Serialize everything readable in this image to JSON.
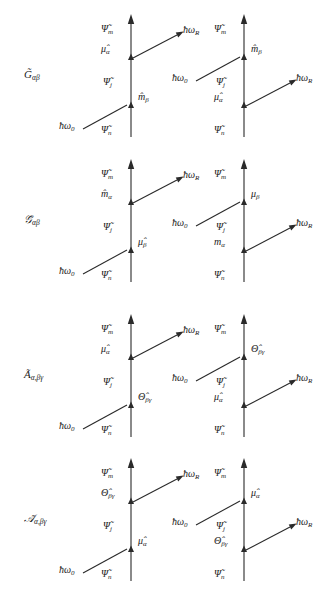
{
  "figure": {
    "type": "diagram",
    "columns": 2,
    "rows": 4,
    "geometry": {
      "left_line_x": 131,
      "right_line_x": 244,
      "row_tops": [
        8,
        153,
        308,
        452
      ],
      "row_height": 130
    },
    "symbols": {
      "psi_tilde": "Ψ̃",
      "hbar": "ħ",
      "omega": "ω",
      "mu_hat": "μ̂",
      "m_hat": "m̂",
      "theta_hat": "Θ̂",
      "mu_plain": "μ",
      "m_plain": "m"
    }
  },
  "rows": [
    {
      "id": "row-G",
      "label": "G̃",
      "label_sub": "αβ",
      "label_full": "G̃αβ",
      "panels": [
        {
          "id": "G-left",
          "states": {
            "top": "Ψ̃",
            "top_sub": "m",
            "mid": "Ψ̃",
            "mid_sub": "j",
            "bottom": "Ψ̃",
            "bottom_sub": "n"
          },
          "upper_vertex": {
            "operator": "μ̂",
            "operator_sub": "α",
            "side": "left"
          },
          "lower_vertex": {
            "operator": "m̂",
            "operator_sub": "β",
            "side": "right"
          },
          "photon_in": {
            "label": "ħω",
            "label_sub": "0",
            "attaches": "lower",
            "direction": "incoming"
          },
          "photon_out": {
            "label": "ħω",
            "label_sub": "R",
            "attaches": "upper",
            "direction": "outgoing"
          }
        },
        {
          "id": "G-right",
          "states": {
            "top": "Ψ̃",
            "top_sub": "m",
            "mid": "Ψ̃",
            "mid_sub": "j",
            "bottom": "Ψ̃",
            "bottom_sub": "n"
          },
          "upper_vertex": {
            "operator": "m̂",
            "operator_sub": "β",
            "side": "right"
          },
          "lower_vertex": {
            "operator": "μ̂",
            "operator_sub": "α",
            "side": "left"
          },
          "photon_in": {
            "label": "ħω",
            "label_sub": "0",
            "attaches": "upper",
            "direction": "incoming"
          },
          "photon_out": {
            "label": "ħω",
            "label_sub": "R",
            "attaches": "lower",
            "direction": "outgoing"
          }
        }
      ]
    },
    {
      "id": "row-Gscript",
      "label": "𝒢̃",
      "label_sub": "αβ",
      "label_full": "𝒢̃αβ",
      "panels": [
        {
          "id": "Gscript-left",
          "states": {
            "top": "Ψ̃",
            "top_sub": "m",
            "mid": "Ψ̃",
            "mid_sub": "j",
            "bottom": "Ψ̃",
            "bottom_sub": "n"
          },
          "upper_vertex": {
            "operator": "m̂",
            "operator_sub": "α",
            "side": "left"
          },
          "lower_vertex": {
            "operator": "μ̂",
            "operator_sub": "β",
            "side": "right"
          },
          "photon_in": {
            "label": "ħω",
            "label_sub": "0",
            "attaches": "lower",
            "direction": "incoming"
          },
          "photon_out": {
            "label": "ħω",
            "label_sub": "R",
            "attaches": "upper",
            "direction": "outgoing"
          }
        },
        {
          "id": "Gscript-right",
          "states": {
            "top": "Ψ̃",
            "top_sub": "m",
            "mid": "Ψ̃",
            "mid_sub": "j",
            "bottom": "Ψ̃",
            "bottom_sub": "n"
          },
          "upper_vertex": {
            "operator": "μ",
            "operator_sub": "β",
            "side": "right"
          },
          "lower_vertex": {
            "operator": "m",
            "operator_sub": "α",
            "side": "left"
          },
          "photon_in": {
            "label": "ħω",
            "label_sub": "0",
            "attaches": "upper",
            "direction": "incoming"
          },
          "photon_out": {
            "label": "ħω",
            "label_sub": "R",
            "attaches": "lower",
            "direction": "outgoing"
          }
        }
      ]
    },
    {
      "id": "row-A",
      "label": "Ã",
      "label_sub": "α,βγ",
      "label_full": "Ãα,βγ",
      "panels": [
        {
          "id": "A-left",
          "states": {
            "top": "Ψ̃",
            "top_sub": "m",
            "mid": "Ψ̃",
            "mid_sub": "j",
            "bottom": "Ψ̃",
            "bottom_sub": "n"
          },
          "upper_vertex": {
            "operator": "μ̂",
            "operator_sub": "α",
            "side": "left"
          },
          "lower_vertex": {
            "operator": "Θ̂",
            "operator_sub": "βγ",
            "side": "right"
          },
          "photon_in": {
            "label": "ħω",
            "label_sub": "0",
            "attaches": "lower",
            "direction": "incoming"
          },
          "photon_out": {
            "label": "ħω",
            "label_sub": "R",
            "attaches": "upper",
            "direction": "outgoing"
          }
        },
        {
          "id": "A-right",
          "states": {
            "top": "Ψ̃",
            "top_sub": "m",
            "mid": "Ψ̃",
            "mid_sub": "j",
            "bottom": "Ψ̃",
            "bottom_sub": "n"
          },
          "upper_vertex": {
            "operator": "Θ̂",
            "operator_sub": "βγ",
            "side": "right"
          },
          "lower_vertex": {
            "operator": "μ̂",
            "operator_sub": "α",
            "side": "left"
          },
          "photon_in": {
            "label": "ħω",
            "label_sub": "0",
            "attaches": "upper",
            "direction": "incoming"
          },
          "photon_out": {
            "label": "ħω",
            "label_sub": "R",
            "attaches": "lower",
            "direction": "outgoing"
          }
        }
      ]
    },
    {
      "id": "row-Ascript",
      "label": "𝒜̃",
      "label_sub": "α,βγ",
      "label_full": "𝒜̃α,βγ",
      "panels": [
        {
          "id": "Ascript-left",
          "states": {
            "top": "Ψ̃",
            "top_sub": "m",
            "mid": "Ψ̃",
            "mid_sub": "j",
            "bottom": "Ψ̃",
            "bottom_sub": "n"
          },
          "upper_vertex": {
            "operator": "Θ̂",
            "operator_sub": "βγ",
            "side": "left"
          },
          "lower_vertex": {
            "operator": "μ̂",
            "operator_sub": "α",
            "side": "right"
          },
          "photon_in": {
            "label": "ħω",
            "label_sub": "0",
            "attaches": "lower",
            "direction": "incoming"
          },
          "photon_out": {
            "label": "ħω",
            "label_sub": "R",
            "attaches": "upper",
            "direction": "outgoing"
          }
        },
        {
          "id": "Ascript-right",
          "states": {
            "top": "Ψ̃",
            "top_sub": "m",
            "mid": "Ψ̃",
            "mid_sub": "j",
            "bottom": "Ψ̃",
            "bottom_sub": "n"
          },
          "upper_vertex": {
            "operator": "μ̂",
            "operator_sub": "α",
            "side": "right"
          },
          "lower_vertex": {
            "operator": "Θ̂",
            "operator_sub": "βγ",
            "side": "left"
          },
          "photon_in": {
            "label": "ħω",
            "label_sub": "0",
            "attaches": "upper",
            "direction": "incoming"
          },
          "photon_out": {
            "label": "ħω",
            "label_sub": "R",
            "attaches": "lower",
            "direction": "outgoing"
          }
        }
      ]
    }
  ],
  "colors": {
    "ink": "#2a2a2a",
    "background": "#ffffff"
  }
}
